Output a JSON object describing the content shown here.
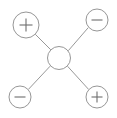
{
  "diagram": {
    "type": "radial-node-link",
    "title": "",
    "background_color": "#ffffff",
    "stroke_color": "#8a8a8a",
    "edge_color": "#8c8c8c",
    "glyph_color": "#6e6e6e",
    "canvas": {
      "width": 117,
      "height": 118
    },
    "center_node": {
      "id": "center",
      "label": "",
      "symbol": "none",
      "cx": 59,
      "cy": 58,
      "r": 11.5
    },
    "outer_nodes": [
      {
        "id": "top-left",
        "position": "top-left",
        "label": "+",
        "symbol": "plus",
        "cx": 26,
        "cy": 25,
        "r": 13
      },
      {
        "id": "top-right",
        "position": "top-right",
        "label": "−",
        "symbol": "minus",
        "cx": 97,
        "cy": 20,
        "r": 11
      },
      {
        "id": "bottom-left",
        "position": "bottom-left",
        "label": "−",
        "symbol": "minus",
        "cx": 20,
        "cy": 97,
        "r": 11
      },
      {
        "id": "bottom-right",
        "position": "bottom-right",
        "label": "+",
        "symbol": "plus",
        "cx": 97,
        "cy": 97,
        "r": 11
      }
    ],
    "edges": [
      {
        "id": "edge-center-top-left",
        "from": "center",
        "to": "top-left"
      },
      {
        "id": "edge-center-top-right",
        "from": "center",
        "to": "top-right"
      },
      {
        "id": "edge-center-bottom-left",
        "from": "center",
        "to": "bottom-left"
      },
      {
        "id": "edge-center-bottom-right",
        "from": "center",
        "to": "bottom-right"
      }
    ]
  }
}
